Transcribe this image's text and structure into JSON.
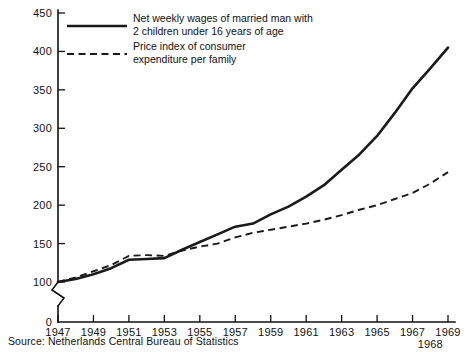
{
  "chart_data": {
    "type": "line",
    "title": "",
    "xlabel": "",
    "ylabel": "",
    "xlim": [
      1947,
      1969
    ],
    "ylim": [
      100,
      450
    ],
    "ytick_values": [
      100,
      150,
      200,
      250,
      300,
      350,
      400,
      450
    ],
    "ytick_labels": [
      "100",
      "150",
      "200",
      "250",
      "300",
      "350",
      "400",
      "450"
    ],
    "y_origin_label": "0",
    "y_axis_broken": true,
    "xtick_values": [
      1947,
      1949,
      1951,
      1953,
      1955,
      1957,
      1959,
      1961,
      1963,
      1965,
      1967,
      1969
    ],
    "xtick_labels": [
      "1947",
      "1949",
      "1951",
      "1953",
      "1955",
      "1957",
      "1959",
      "1961",
      "1963",
      "1965",
      "1967",
      "1969"
    ],
    "xtick_secondary_label": "1968",
    "xtick_secondary_value": 1968,
    "grid": false,
    "legend_position": "top-left",
    "x": [
      1947,
      1948,
      1949,
      1950,
      1951,
      1952,
      1953,
      1954,
      1955,
      1956,
      1957,
      1958,
      1959,
      1960,
      1961,
      1962,
      1963,
      1964,
      1965,
      1966,
      1967,
      1968,
      1969
    ],
    "series": [
      {
        "name": "Net weekly wages of married man with 2 children under 16 years of age",
        "style": "solid",
        "values": [
          100,
          104,
          110,
          118,
          129,
          130,
          131,
          142,
          152,
          162,
          172,
          176,
          188,
          198,
          211,
          226,
          246,
          266,
          290,
          320,
          352,
          378,
          405
        ]
      },
      {
        "name": "Price index of consumer expenditure per family",
        "style": "dashed",
        "values": [
          100,
          106,
          114,
          122,
          134,
          135,
          134,
          141,
          146,
          150,
          158,
          164,
          168,
          172,
          176,
          181,
          187,
          194,
          200,
          208,
          216,
          228,
          243
        ]
      }
    ]
  },
  "legend": {
    "entries": [
      {
        "line1": "Net weekly wages of married man with",
        "line2": "2 children under 16 years of age",
        "style": "solid"
      },
      {
        "line1": "Price index of consumer",
        "line2": "expenditure per family",
        "style": "dashed"
      }
    ]
  },
  "source": {
    "text": "Source: Netherlands Central Bureau of Statistics"
  },
  "colors": {
    "ink": "#111111",
    "series": "#1a1a1a",
    "background": "#ffffff"
  }
}
